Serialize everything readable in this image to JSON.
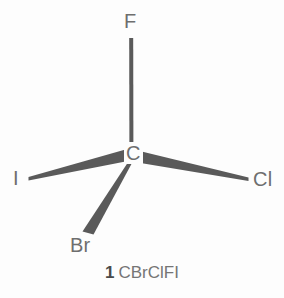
{
  "figure": {
    "kind": "stereochemical-structure-diagram",
    "background_color": "#fdfdfd",
    "bond_color": "#5a5a5a",
    "label_color": "#6e6e6e"
  },
  "molecule": {
    "center_atom": {
      "symbol": "C",
      "name": "carbon-center"
    },
    "substituents": [
      {
        "symbol": "F",
        "name": "fluorine",
        "bond_style": "plain-line",
        "direction": "up"
      },
      {
        "symbol": "I",
        "name": "iodine",
        "bond_style": "wedge",
        "direction": "left"
      },
      {
        "symbol": "Cl",
        "name": "chlorine",
        "bond_style": "wedge",
        "direction": "right"
      },
      {
        "symbol": "Br",
        "name": "bromine",
        "bond_style": "wedge",
        "direction": "down-left"
      }
    ]
  },
  "caption": {
    "index": "1",
    "formula": "CBrClFI"
  }
}
